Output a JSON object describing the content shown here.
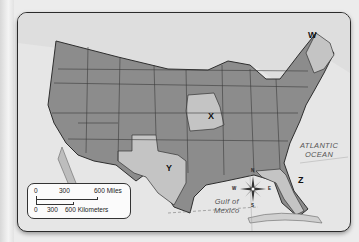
{
  "map": {
    "type": "outline map",
    "region": "United States",
    "markers": [
      {
        "id": "W",
        "label": "W",
        "region": "Maine"
      },
      {
        "id": "X",
        "label": "X",
        "region": "Missouri"
      },
      {
        "id": "Y",
        "label": "Y",
        "region": "Texas"
      },
      {
        "id": "Z",
        "label": "Z",
        "region": "Florida"
      }
    ],
    "water_labels": {
      "atlantic_line1": "ATLANTIC",
      "atlantic_line2": "OCEAN",
      "gulf_line1": "Gulf of",
      "gulf_line2": "Mexico"
    },
    "colors": {
      "land": "#8c8c8c",
      "highlight": "#c4c4c4",
      "water": "#e6e6e6",
      "border": "#3a3a3a"
    }
  },
  "scale": {
    "miles_ticks": [
      "0",
      "300",
      "600 Miles"
    ],
    "km_ticks": [
      "0",
      "300",
      "600 Kilometers"
    ]
  },
  "compass": {
    "n": "N",
    "s": "S",
    "e": "E",
    "w": "W"
  }
}
